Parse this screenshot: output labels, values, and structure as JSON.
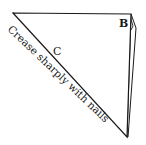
{
  "diagram": {
    "type": "origami-fold-step",
    "labels": {
      "corner_b": "B",
      "edge_c": "C",
      "instruction": "Crease sharply with nails"
    },
    "colors": {
      "stroke": "#1a1a1a",
      "paper": "#ffffff"
    }
  }
}
